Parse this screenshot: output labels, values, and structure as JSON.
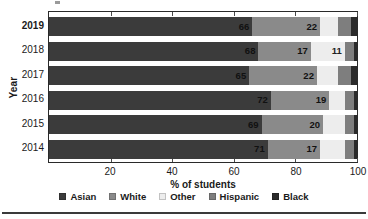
{
  "chart_data": {
    "type": "bar",
    "orientation": "horizontal",
    "stacked": true,
    "normalized_percent": true,
    "title": "",
    "xlabel": "% of students",
    "ylabel": "Year",
    "xlim": [
      0,
      100
    ],
    "xticks": [
      20,
      40,
      60,
      80,
      100
    ],
    "xticklabels": [
      "20",
      "40",
      "60",
      "80",
      "100"
    ],
    "grid": false,
    "legend_position": "bottom",
    "categories": [
      "2019",
      "2018",
      "2017",
      "2016",
      "2015",
      "2014"
    ],
    "series": [
      {
        "name": "Asian",
        "color": "#3b3b3b",
        "values": [
          66,
          68,
          65,
          72,
          69,
          71
        ],
        "labels": [
          "66",
          "68",
          "65",
          "72",
          "69",
          "71"
        ]
      },
      {
        "name": "White",
        "color": "#8a8a8a",
        "values": [
          22,
          17,
          22,
          19,
          20,
          17
        ],
        "labels": [
          "22",
          "17",
          "22",
          "19",
          "20",
          "17"
        ]
      },
      {
        "name": "Other",
        "color": "#ededed",
        "values": [
          6,
          11,
          7,
          5,
          7,
          8
        ],
        "labels": [
          "",
          "11",
          "",
          "",
          "",
          ""
        ]
      },
      {
        "name": "Hispanic",
        "color": "#7e7e7e",
        "values": [
          4,
          3,
          4,
          3,
          3,
          3
        ],
        "labels": [
          "",
          "",
          "",
          "",
          "",
          ""
        ]
      },
      {
        "name": "Black",
        "color": "#2b2b2b",
        "values": [
          2,
          1,
          2,
          1,
          1,
          1
        ],
        "labels": [
          "",
          "",
          "",
          "",
          "",
          ""
        ]
      }
    ]
  },
  "axis": {
    "y_title": "Year",
    "x_title": "% of students",
    "y_ticklabels": [
      "2019",
      "2018",
      "2017",
      "2016",
      "2015",
      "2014"
    ],
    "y_highlight_index": 0,
    "x_ticklabels": [
      "20",
      "40",
      "60",
      "80",
      "100"
    ]
  },
  "legend": {
    "items": [
      {
        "label": "Asian",
        "color": "#3b3b3b"
      },
      {
        "label": "White",
        "color": "#8a8a8a"
      },
      {
        "label": "Other",
        "color": "#ededed"
      },
      {
        "label": "Hispanic",
        "color": "#7e7e7e"
      },
      {
        "label": "Black",
        "color": "#2b2b2b"
      }
    ]
  }
}
